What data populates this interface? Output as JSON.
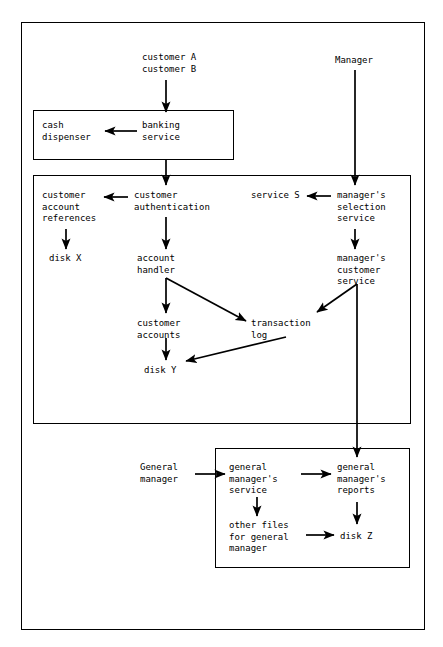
{
  "diagram": {
    "type": "data-flow-diagram",
    "canvas": {
      "width": 443,
      "height": 647
    },
    "colors": {
      "background": "#ffffff",
      "stroke": "#000000",
      "text": "#000000"
    },
    "frames": [
      {
        "id": "outer-frame",
        "name": "system-boundary",
        "label": "",
        "x": 21,
        "y": 22,
        "width": 404,
        "height": 608
      },
      {
        "id": "banking-service-box",
        "name": "banking-service-layer",
        "label": "",
        "x": 33,
        "y": 110,
        "width": 201,
        "height": 50
      },
      {
        "id": "core-services-box",
        "name": "core-services-layer",
        "label": "",
        "x": 33,
        "y": 175,
        "width": 378,
        "height": 249
      },
      {
        "id": "general-manager-box",
        "name": "general-manager-layer",
        "label": "",
        "x": 215,
        "y": 448,
        "width": 195,
        "height": 120
      }
    ],
    "nodes": [
      {
        "id": "customer-a-b",
        "lines": [
          "customer A",
          "customer B"
        ],
        "x": 142,
        "y": 52,
        "align": "left"
      },
      {
        "id": "manager",
        "lines": [
          "Manager"
        ],
        "x": 335,
        "y": 55,
        "align": "left"
      },
      {
        "id": "cash-dispenser",
        "lines": [
          "cash",
          "dispenser"
        ],
        "x": 42,
        "y": 120,
        "align": "left"
      },
      {
        "id": "banking-service",
        "lines": [
          "banking",
          "service"
        ],
        "x": 142,
        "y": 120,
        "align": "left"
      },
      {
        "id": "customer-account-references",
        "lines": [
          "customer",
          "account",
          "references"
        ],
        "x": 42,
        "y": 190,
        "align": "left"
      },
      {
        "id": "customer-authentication",
        "lines": [
          "customer",
          "authentication"
        ],
        "x": 134,
        "y": 190,
        "align": "left"
      },
      {
        "id": "service-s",
        "lines": [
          "service S"
        ],
        "x": 251,
        "y": 190,
        "align": "left"
      },
      {
        "id": "managers-selection-service",
        "lines": [
          "manager's",
          "selection",
          "service"
        ],
        "x": 337,
        "y": 190,
        "align": "left"
      },
      {
        "id": "disk-x",
        "lines": [
          "disk X"
        ],
        "x": 49,
        "y": 253,
        "align": "left"
      },
      {
        "id": "account-handler",
        "lines": [
          "account",
          "handler"
        ],
        "x": 137,
        "y": 253,
        "align": "left"
      },
      {
        "id": "managers-customer-service",
        "lines": [
          "manager's",
          "customer",
          "service"
        ],
        "x": 337,
        "y": 253,
        "align": "left"
      },
      {
        "id": "customer-accounts",
        "lines": [
          "customer",
          "accounts"
        ],
        "x": 137,
        "y": 318,
        "align": "left"
      },
      {
        "id": "transaction-log",
        "lines": [
          "transaction",
          "log"
        ],
        "x": 251,
        "y": 318,
        "align": "left"
      },
      {
        "id": "disk-y",
        "lines": [
          "disk Y"
        ],
        "x": 144,
        "y": 365,
        "align": "left"
      },
      {
        "id": "general-manager-actor",
        "lines": [
          "General",
          "manager"
        ],
        "x": 140,
        "y": 462,
        "align": "left"
      },
      {
        "id": "general-managers-service",
        "lines": [
          "general",
          "manager's",
          "service"
        ],
        "x": 229,
        "y": 462,
        "align": "left"
      },
      {
        "id": "general-managers-reports",
        "lines": [
          "general",
          "manager's",
          "reports"
        ],
        "x": 337,
        "y": 462,
        "align": "left"
      },
      {
        "id": "other-files-for-general-manager",
        "lines": [
          "other files",
          "for general",
          "manager"
        ],
        "x": 229,
        "y": 520,
        "align": "left"
      },
      {
        "id": "disk-z",
        "lines": [
          "disk Z"
        ],
        "x": 340,
        "y": 531,
        "align": "left"
      }
    ],
    "edges": [
      {
        "id": "edge-customers-to-banking-service",
        "from": "customer-a-b",
        "to": "banking-service",
        "kind": "straight-vertical"
      },
      {
        "id": "edge-banking-service-to-cash-dispenser",
        "from": "banking-service",
        "to": "cash-dispenser",
        "kind": "straight-horizontal"
      },
      {
        "id": "edge-banking-service-to-customer-auth",
        "from": "banking-service",
        "to": "customer-authentication",
        "kind": "straight-vertical"
      },
      {
        "id": "edge-manager-to-managers-selection",
        "from": "manager",
        "to": "managers-selection-service",
        "kind": "straight-vertical"
      },
      {
        "id": "edge-managers-selection-to-service-s",
        "from": "managers-selection-service",
        "to": "service-s",
        "kind": "straight-horizontal"
      },
      {
        "id": "edge-customer-auth-to-account-refs",
        "from": "customer-authentication",
        "to": "customer-account-references",
        "kind": "straight-horizontal"
      },
      {
        "id": "edge-account-refs-to-disk-x",
        "from": "customer-account-references",
        "to": "disk-x",
        "kind": "straight-vertical"
      },
      {
        "id": "edge-customer-auth-to-account-handler",
        "from": "customer-authentication",
        "to": "account-handler",
        "kind": "straight-vertical"
      },
      {
        "id": "edge-managers-selection-to-managers-cust",
        "from": "managers-selection-service",
        "to": "managers-customer-service",
        "kind": "straight-vertical"
      },
      {
        "id": "edge-account-handler-to-customer-accounts",
        "from": "account-handler",
        "to": "customer-accounts",
        "kind": "straight-vertical"
      },
      {
        "id": "edge-account-handler-to-transaction-log",
        "from": "account-handler",
        "to": "transaction-log",
        "kind": "diagonal"
      },
      {
        "id": "edge-customer-accounts-to-disk-y",
        "from": "customer-accounts",
        "to": "disk-y",
        "kind": "straight-vertical"
      },
      {
        "id": "edge-transaction-log-to-disk-y",
        "from": "transaction-log",
        "to": "disk-y",
        "kind": "diagonal"
      },
      {
        "id": "edge-managers-cust-to-transaction-log",
        "from": "managers-customer-service",
        "to": "transaction-log",
        "kind": "diagonal"
      },
      {
        "id": "edge-managers-cust-to-gm-reports",
        "from": "managers-customer-service",
        "to": "general-managers-reports",
        "kind": "straight-vertical"
      },
      {
        "id": "edge-gm-actor-to-gm-service",
        "from": "general-manager-actor",
        "to": "general-managers-service",
        "kind": "straight-horizontal"
      },
      {
        "id": "edge-gm-service-to-gm-reports",
        "from": "general-managers-service",
        "to": "general-managers-reports",
        "kind": "straight-horizontal"
      },
      {
        "id": "edge-gm-service-to-other-files",
        "from": "general-managers-service",
        "to": "other-files-for-general-manager",
        "kind": "straight-vertical"
      },
      {
        "id": "edge-other-files-to-disk-z",
        "from": "other-files-for-general-manager",
        "to": "disk-z",
        "kind": "straight-horizontal"
      },
      {
        "id": "edge-gm-reports-to-disk-z",
        "from": "general-managers-reports",
        "to": "disk-z",
        "kind": "straight-vertical"
      }
    ]
  }
}
